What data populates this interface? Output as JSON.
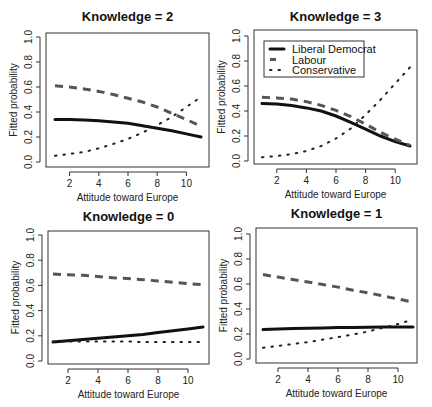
{
  "colors": {
    "liberal_democrat": "#111111",
    "labour": "#555555",
    "conservative": "#222222",
    "axis": "#333333"
  },
  "legend": {
    "items": [
      {
        "label": "Liberal Democrat",
        "style": "solid"
      },
      {
        "label": "Labour",
        "style": "dashed"
      },
      {
        "label": "Conservative",
        "style": "dotted"
      }
    ]
  },
  "chart_data": [
    {
      "type": "line",
      "title": "Knowledge = 2",
      "xlabel": "Attitude toward Europe",
      "ylabel": "Fitted probability",
      "xlim": [
        1,
        11
      ],
      "ylim": [
        0,
        1
      ],
      "xticks": [
        2,
        4,
        6,
        8,
        10
      ],
      "yticks": [
        0.0,
        0.2,
        0.4,
        0.6,
        0.8,
        1.0
      ],
      "x": [
        1,
        2,
        3,
        4,
        5,
        6,
        7,
        8,
        9,
        10,
        11
      ],
      "series": [
        {
          "name": "Liberal Democrat",
          "values": [
            0.34,
            0.34,
            0.335,
            0.33,
            0.32,
            0.31,
            0.29,
            0.27,
            0.25,
            0.225,
            0.2
          ]
        },
        {
          "name": "Labour",
          "values": [
            0.61,
            0.6,
            0.585,
            0.565,
            0.54,
            0.51,
            0.48,
            0.44,
            0.39,
            0.34,
            0.285
          ]
        },
        {
          "name": "Conservative",
          "values": [
            0.05,
            0.065,
            0.08,
            0.11,
            0.145,
            0.185,
            0.235,
            0.295,
            0.36,
            0.44,
            0.52
          ]
        }
      ]
    },
    {
      "type": "line",
      "title": "Knowledge = 3",
      "xlabel": "Attitude toward Europe",
      "ylabel": "Fitted probability",
      "xlim": [
        1,
        11
      ],
      "ylim": [
        0,
        1
      ],
      "xticks": [
        2,
        4,
        6,
        8,
        10
      ],
      "yticks": [
        0.0,
        0.2,
        0.4,
        0.6,
        0.8,
        1.0
      ],
      "legend_position": "topleft",
      "x": [
        1,
        2,
        3,
        4,
        5,
        6,
        7,
        8,
        9,
        10,
        11
      ],
      "series": [
        {
          "name": "Liberal Democrat",
          "values": [
            0.46,
            0.455,
            0.445,
            0.425,
            0.4,
            0.36,
            0.31,
            0.255,
            0.2,
            0.155,
            0.12
          ]
        },
        {
          "name": "Labour",
          "values": [
            0.51,
            0.505,
            0.495,
            0.475,
            0.445,
            0.405,
            0.355,
            0.295,
            0.23,
            0.175,
            0.125
          ]
        },
        {
          "name": "Conservative",
          "values": [
            0.03,
            0.04,
            0.055,
            0.08,
            0.12,
            0.18,
            0.26,
            0.37,
            0.49,
            0.62,
            0.75
          ]
        }
      ]
    },
    {
      "type": "line",
      "title": "Knowledge = 0",
      "xlabel": "Attitude toward Europe",
      "ylabel": "Fitted probability",
      "xlim": [
        1,
        11
      ],
      "ylim": [
        0,
        1
      ],
      "xticks": [
        2,
        4,
        6,
        8,
        10
      ],
      "yticks": [
        0.0,
        0.2,
        0.4,
        0.6,
        0.8,
        1.0
      ],
      "x": [
        1,
        2,
        3,
        4,
        5,
        6,
        7,
        8,
        9,
        10,
        11
      ],
      "series": [
        {
          "name": "Liberal Democrat",
          "values": [
            0.15,
            0.16,
            0.17,
            0.18,
            0.19,
            0.2,
            0.21,
            0.225,
            0.24,
            0.255,
            0.27
          ]
        },
        {
          "name": "Labour",
          "values": [
            0.69,
            0.685,
            0.68,
            0.67,
            0.66,
            0.655,
            0.645,
            0.635,
            0.625,
            0.615,
            0.605
          ]
        },
        {
          "name": "Conservative",
          "values": [
            0.155,
            0.155,
            0.155,
            0.155,
            0.155,
            0.155,
            0.15,
            0.15,
            0.15,
            0.15,
            0.15
          ]
        }
      ]
    },
    {
      "type": "line",
      "title": "Knowledge = 1",
      "xlabel": "Attitude toward Europe",
      "ylabel": "Fitted probability",
      "xlim": [
        1,
        11
      ],
      "ylim": [
        0,
        1
      ],
      "xticks": [
        2,
        4,
        6,
        8,
        10
      ],
      "yticks": [
        0.0,
        0.2,
        0.4,
        0.6,
        0.8,
        1.0
      ],
      "x": [
        1,
        2,
        3,
        4,
        5,
        6,
        7,
        8,
        9,
        10,
        11
      ],
      "series": [
        {
          "name": "Liberal Democrat",
          "values": [
            0.235,
            0.24,
            0.243,
            0.246,
            0.249,
            0.251,
            0.253,
            0.254,
            0.255,
            0.256,
            0.256
          ]
        },
        {
          "name": "Labour",
          "values": [
            0.675,
            0.655,
            0.635,
            0.615,
            0.595,
            0.575,
            0.55,
            0.53,
            0.505,
            0.48,
            0.455
          ]
        },
        {
          "name": "Conservative",
          "values": [
            0.09,
            0.105,
            0.12,
            0.135,
            0.155,
            0.175,
            0.195,
            0.22,
            0.25,
            0.28,
            0.315
          ]
        }
      ]
    }
  ]
}
